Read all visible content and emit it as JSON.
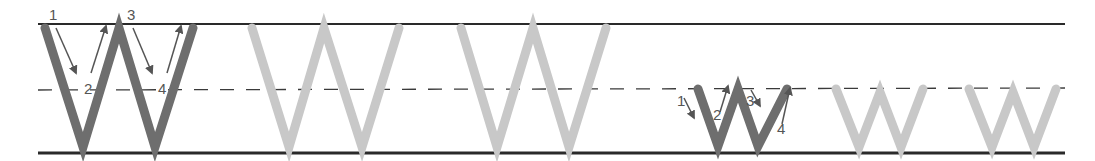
{
  "worksheet": {
    "letter_upper": "W",
    "letter_lower": "w",
    "colors": {
      "guide_line": "#2a2a2a",
      "model_stroke": "#6e6e6e",
      "trace_stroke": "#c8c8c8",
      "arrow": "#555555",
      "number": "#555555"
    },
    "uppercase_demo": {
      "step_labels": [
        "1",
        "2",
        "3",
        "4"
      ]
    },
    "lowercase_demo": {
      "step_labels": [
        "1",
        "2",
        "3",
        "4"
      ]
    },
    "uppercase_trace_count": 2,
    "lowercase_trace_count": 2
  }
}
